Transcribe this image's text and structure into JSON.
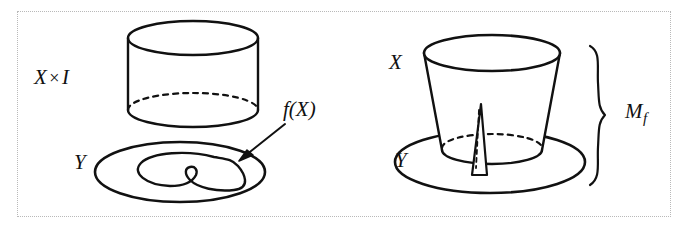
{
  "figure": {
    "background_color": "#ffffff",
    "ink_color": "#111111",
    "border_color": "#b9b9b9",
    "border_style": "dotted",
    "width": 688,
    "height": 230
  },
  "labels": {
    "x_times_i": "X",
    "times_symbol": "×",
    "interval": "I",
    "y_left": "Y",
    "f_of_x": "f(X)",
    "x_right": "X",
    "y_right": "Y",
    "mapping_cylinder": "M",
    "mapping_cylinder_subscript": "f"
  },
  "panels": {
    "left": {
      "name": "domain-and-codomain",
      "shapes": [
        "cylinder X×I",
        "disk Y",
        "image curve f(X)",
        "pointer arrow"
      ]
    },
    "right": {
      "name": "mapping-cylinder",
      "shapes": [
        "truncated cone X",
        "disk Y",
        "fin spike",
        "brace"
      ]
    }
  },
  "geometry": {
    "left_cylinder": {
      "center_x": 193,
      "top_y": 38,
      "bottom_y": 110,
      "radius_x": 65,
      "radius_y": 17
    },
    "left_disk": {
      "center_x": 180,
      "center_y": 172,
      "radius_x": 85,
      "radius_y": 30
    },
    "right_cone": {
      "center_x": 492,
      "top_y": 53,
      "bottom_y": 148,
      "top_radius_x": 68,
      "bottom_radius_x": 50,
      "top_radius_y": 18,
      "bottom_radius_y": 14
    },
    "right_disk": {
      "center_x": 490,
      "center_y": 162,
      "radius_x": 95,
      "radius_y": 31
    },
    "brace": {
      "x": 600,
      "top_y": 45,
      "bottom_y": 186
    }
  }
}
